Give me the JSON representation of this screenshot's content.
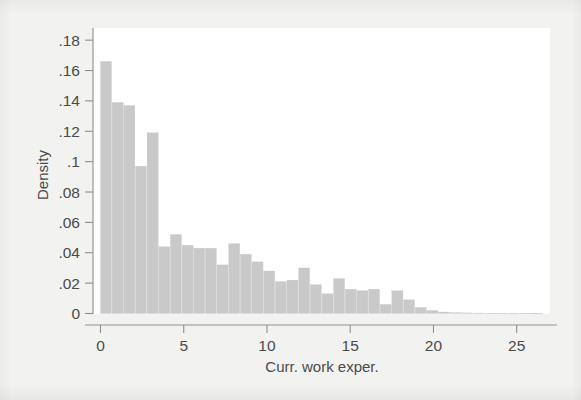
{
  "figure": {
    "background_color": "#f2f2f0",
    "plot_background_color": "#ffffff",
    "bar_color": "#c9c9c9",
    "axis_color": "#8f8f8f",
    "text_color": "#4a4a4a"
  },
  "chart_data": {
    "type": "bar",
    "title": "",
    "subtitle": "",
    "xlabel": "Curr. work exper.",
    "ylabel": "Density",
    "xlim": [
      -0.45,
      27.0
    ],
    "ylim": [
      0,
      0.188
    ],
    "xticks": [
      0,
      5,
      10,
      15,
      20,
      25
    ],
    "xticklabels": [
      "0",
      "5",
      "10",
      "15",
      "20",
      "25"
    ],
    "yticks": [
      0,
      0.02,
      0.04,
      0.06,
      0.08,
      0.1,
      0.12,
      0.14,
      0.16,
      0.18
    ],
    "yticklabels": [
      "0",
      ".02",
      ".04",
      ".06",
      ".08",
      ".1",
      ".12",
      ".14",
      ".16",
      ".18"
    ],
    "grid": false,
    "legend": false,
    "bin_width": 0.7,
    "bin_starts": [
      0.0,
      0.7,
      1.4,
      2.1,
      2.8,
      3.5,
      4.2,
      4.9,
      5.6,
      6.3,
      7.0,
      7.7,
      8.4,
      9.1,
      9.8,
      10.5,
      11.2,
      11.9,
      12.6,
      13.3,
      14.0,
      14.7,
      15.4,
      16.1,
      16.8,
      17.5,
      18.2,
      18.9,
      19.6,
      20.3,
      21.0,
      21.7,
      22.4,
      23.1,
      23.8,
      24.5,
      25.2,
      25.9
    ],
    "categories": [
      "0.0-0.7",
      "0.7-1.4",
      "1.4-2.1",
      "2.1-2.8",
      "2.8-3.5",
      "3.5-4.2",
      "4.2-4.9",
      "4.9-5.6",
      "5.6-6.3",
      "6.3-7.0",
      "7.0-7.7",
      "7.7-8.4",
      "8.4-9.1",
      "9.1-9.8",
      "9.8-10.5",
      "10.5-11.2",
      "11.2-11.9",
      "11.9-12.6",
      "12.6-13.3",
      "13.3-14.0",
      "14.0-14.7",
      "14.7-15.4",
      "15.4-16.1",
      "16.1-16.8",
      "16.8-17.5",
      "17.5-18.2",
      "18.2-18.9",
      "18.9-19.6",
      "19.6-20.3",
      "20.3-21.0",
      "21.0-21.7",
      "21.7-22.4",
      "22.4-23.1",
      "23.1-23.8",
      "23.8-24.5",
      "24.5-25.2",
      "25.2-25.9",
      "25.9-26.6"
    ],
    "values": [
      0.166,
      0.139,
      0.137,
      0.097,
      0.119,
      0.044,
      0.052,
      0.045,
      0.043,
      0.043,
      0.032,
      0.046,
      0.039,
      0.034,
      0.028,
      0.021,
      0.022,
      0.03,
      0.019,
      0.013,
      0.023,
      0.016,
      0.015,
      0.016,
      0.006,
      0.015,
      0.009,
      0.004,
      0.002,
      0.001,
      0.0006,
      0.0004,
      0.0003,
      0.0002,
      0.0002,
      0.0002,
      0.0002,
      0.0001
    ],
    "ylabel_rotation": -90
  }
}
